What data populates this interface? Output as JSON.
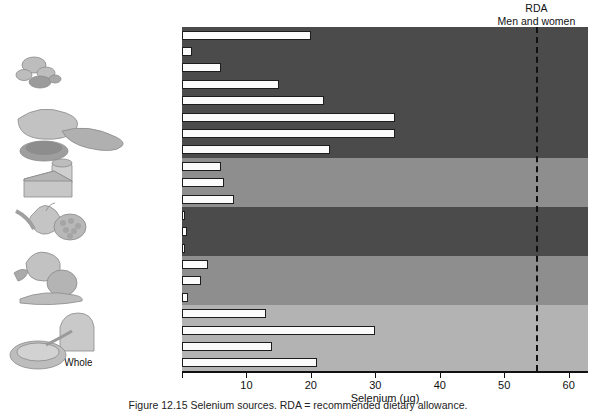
{
  "chart_data": {
    "type": "bar",
    "orientation": "horizontal",
    "title": "",
    "xlabel": "Selenium (µg)",
    "ylabel": "",
    "xlim": [
      0,
      63
    ],
    "xticks": [
      0,
      10,
      20,
      30,
      40,
      50,
      60
    ],
    "xticklabels": [
      "",
      "10",
      "20",
      "30",
      "40",
      "50",
      "60"
    ],
    "grid": false,
    "legend": null,
    "categories": [
      "Sunflower seeds (1/4 c)",
      "Walnuts (1/4 c)",
      "Lentils (1 c)",
      "Eggs (1)",
      "Beef (3 oz)",
      "Crab (3 oz)",
      "Salmon (3 oz)",
      "Chicken (3 oz)",
      "1% milk (1 c)",
      "Cheese, cheddar (1.5 oz)",
      "Yogurt (1 c)",
      "Orange (1 med)",
      "Kiwi (2 med)",
      "Apple (1 med)",
      "Broccoli, cooked (1 c)",
      "Spinach, cooked (1 c)",
      "Potato, baked (1 med)",
      "Oatmeal (1 c)",
      "Spaghetti (1 c)",
      "White bread (2 sl)",
      "Whole-wheat bread (2 sl)"
    ],
    "values": [
      20,
      1.5,
      6,
      15,
      22,
      33,
      33,
      23,
      6,
      6.5,
      8,
      0.5,
      0.8,
      0.5,
      4,
      3,
      1,
      13,
      30,
      14,
      21
    ],
    "annotations": [
      {
        "name": "rda-reference-line",
        "label_line1": "RDA",
        "label_line2": "Men and women",
        "x_value": 55,
        "style": "dashed-vertical"
      }
    ],
    "bands": [
      {
        "name": "protein-foods-band",
        "from_index": 0,
        "to_index": 7,
        "shade": "dark"
      },
      {
        "name": "dairy-band",
        "from_index": 8,
        "to_index": 10,
        "shade": "medium"
      },
      {
        "name": "fruits-band",
        "from_index": 11,
        "to_index": 13,
        "shade": "dark"
      },
      {
        "name": "vegetables-band",
        "from_index": 14,
        "to_index": 16,
        "shade": "medium"
      },
      {
        "name": "grains-band",
        "from_index": 17,
        "to_index": 20,
        "shade": "light"
      }
    ],
    "colors": {
      "band_dark": "#4b4b4b",
      "band_medium": "#8e8e8e",
      "band_light": "#b3b3b3",
      "bar_fill": "#fbfbfb",
      "bar_stroke": "#1d1d1d",
      "axis": "#111111",
      "rda_line": "#111111",
      "background": "#ffffff"
    }
  },
  "illustrations": [
    {
      "name": "nuts-and-seeds-illustration"
    },
    {
      "name": "meat-and-fish-illustration"
    },
    {
      "name": "cheese-and-milk-illustration"
    },
    {
      "name": "fruit-illustration"
    },
    {
      "name": "vegetables-illustration"
    },
    {
      "name": "bread-and-cereal-illustration"
    }
  ],
  "caption": {
    "text": "Figure 12.15 Selenium sources. RDA = recommended dietary allowance."
  }
}
